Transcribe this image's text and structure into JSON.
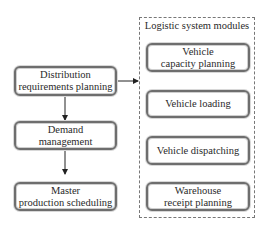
{
  "left_flow": {
    "boxes": [
      {
        "line1": "Distribution",
        "line2": "requirements planning"
      },
      {
        "line1": "Demand",
        "line2": "management"
      },
      {
        "line1": "Master",
        "line2": "production scheduling"
      }
    ]
  },
  "module_group": {
    "title": "Logistic system modules",
    "boxes": [
      {
        "line1": "Vehicle",
        "line2": "capacity planning"
      },
      {
        "line1": "Vehicle loading",
        "line2": ""
      },
      {
        "line1": "Vehicle dispatching",
        "line2": ""
      },
      {
        "line1": "Warehouse",
        "line2": "receipt planning"
      }
    ]
  },
  "colors": {
    "border": "#6e6e6e",
    "arrow": "#222222",
    "dashed": "#777777"
  }
}
